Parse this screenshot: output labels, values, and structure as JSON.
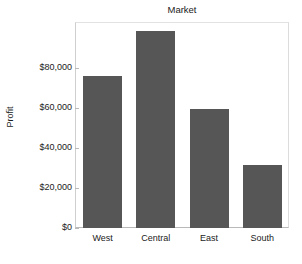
{
  "chart_data": {
    "type": "bar",
    "title": "Market",
    "xlabel": "",
    "ylabel": "Profit",
    "categories": [
      "West",
      "Central",
      "East",
      "South"
    ],
    "values": [
      75800,
      98000,
      59500,
      31200
    ],
    "value_labels": [
      "$75,800",
      "$98,000",
      "$59,500",
      "$31,200"
    ],
    "ylim": [
      0,
      103000
    ],
    "yticks": [
      0,
      20000,
      40000,
      60000,
      80000
    ],
    "ytick_labels": [
      "$0",
      "$20,000",
      "$40,000",
      "$60,000",
      "$80,000"
    ],
    "grid": false,
    "legend": false,
    "bar_color": "#565656",
    "axis_color": "#b9b9b9",
    "background": "#ffffff"
  },
  "axis": {
    "y_title": "Profit",
    "ticks": [
      {
        "label": "$80,000",
        "value": 80000
      },
      {
        "label": "$60,000",
        "value": 60000
      },
      {
        "label": "$40,000",
        "value": 40000
      },
      {
        "label": "$20,000",
        "value": 20000
      },
      {
        "label": "$0",
        "value": 0
      }
    ]
  },
  "header": {
    "title": "Market"
  }
}
